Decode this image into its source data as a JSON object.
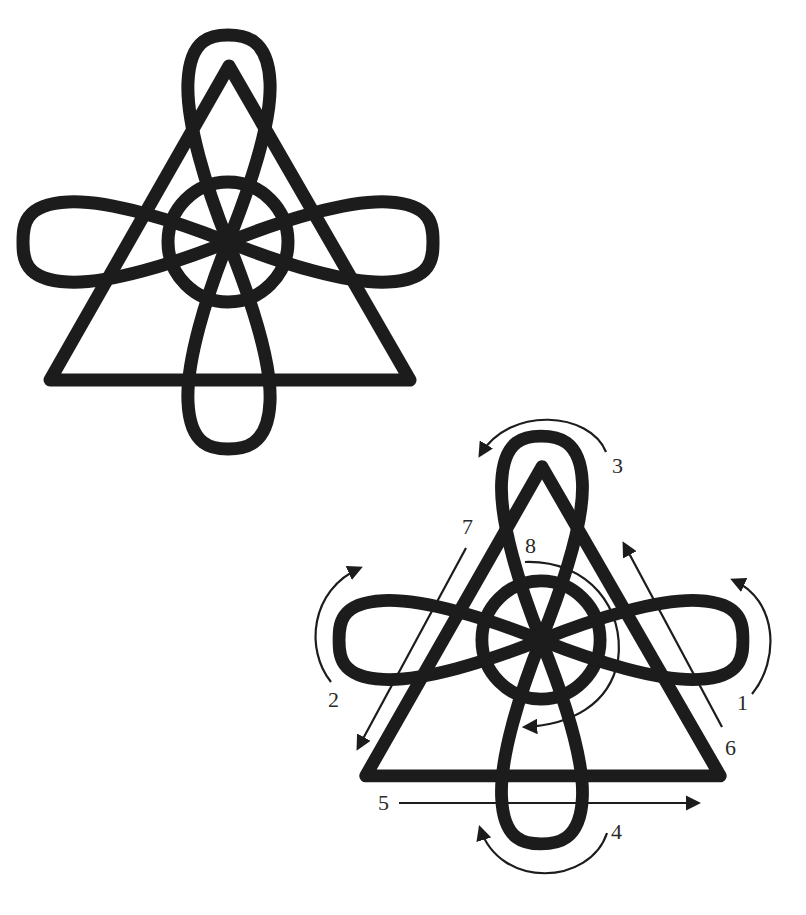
{
  "figures": [
    {
      "id": "plain-knot",
      "description": "Triangle interlaced with circle and four loops (top, bottom, left, right)"
    },
    {
      "id": "annotated-knot",
      "description": "Same knot with numbered drawing-order arrows",
      "steps": [
        {
          "number": "1",
          "direction": "counter-clockwise around right lobe, upward"
        },
        {
          "number": "2",
          "direction": "clockwise around left lobe, upward"
        },
        {
          "number": "3",
          "direction": "counter-clockwise over top loop, leftward"
        },
        {
          "number": "4",
          "direction": "clockwise under bottom loop, leftward"
        },
        {
          "number": "5",
          "direction": "straight line left to right along base"
        },
        {
          "number": "6",
          "direction": "straight line up along right side"
        },
        {
          "number": "7",
          "direction": "straight line down along left side"
        },
        {
          "number": "8",
          "direction": "clockwise around circle"
        }
      ]
    }
  ],
  "labels": {
    "l1": "1",
    "l2": "2",
    "l3": "3",
    "l4": "4",
    "l5": "5",
    "l6": "6",
    "l7": "7",
    "l8": "8"
  },
  "colors": {
    "stroke": "#1c1c1c",
    "background": "#ffffff"
  }
}
